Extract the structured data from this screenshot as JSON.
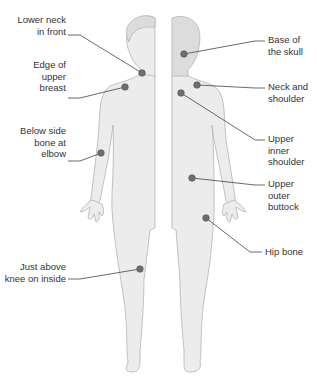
{
  "diagram": {
    "colors": {
      "body_fill": "#ececec",
      "body_stroke": "#b4b4b4",
      "dot_fill": "#6e6e6e",
      "dot_stroke": "#555555",
      "leader_line": "#444444",
      "text": "#333333"
    },
    "views": [
      {
        "name": "front",
        "side": "left"
      },
      {
        "name": "back",
        "side": "right"
      }
    ],
    "points": [
      {
        "id": "lower-neck-front",
        "view": "front",
        "label": "Lower neck\nin front"
      },
      {
        "id": "edge-upper-breast",
        "view": "front",
        "label": "Edge of\nupper\nbreast"
      },
      {
        "id": "below-side-bone-elbow",
        "view": "front",
        "label": "Below side\nbone at\nelbow"
      },
      {
        "id": "above-knee-inside",
        "view": "front",
        "label": "Just above\nknee on inside"
      },
      {
        "id": "base-of-skull",
        "view": "back",
        "label": "Base of\nthe skull"
      },
      {
        "id": "neck-and-shoulder",
        "view": "back",
        "label": "Neck and\nshoulder"
      },
      {
        "id": "upper-inner-shoulder",
        "view": "back",
        "label": "Upper inner\nshoulder"
      },
      {
        "id": "upper-outer-buttock",
        "view": "back",
        "label": "Upper outer\nbuttock"
      },
      {
        "id": "hip-bone",
        "view": "back",
        "label": "Hip bone"
      }
    ]
  }
}
